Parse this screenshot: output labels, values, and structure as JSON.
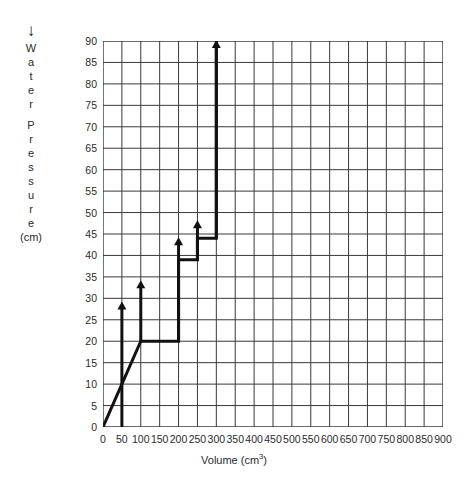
{
  "chart_data": {
    "type": "line",
    "title": "",
    "xlabel": "Volume (cm3)",
    "xlabel_base": "Volume (cm",
    "xlabel_sup": "3",
    "xlabel_tail": ")",
    "ylabel": "Water Pressure (cm)",
    "ylabel_letters": [
      "W",
      "a",
      "t",
      "e",
      "r",
      "",
      "P",
      "r",
      "e",
      "s",
      "s",
      "u",
      "r",
      "e"
    ],
    "ylabel_unit": "(cm)",
    "ylabel_arrow": "↓",
    "xlim": [
      0,
      900
    ],
    "ylim": [
      0,
      90
    ],
    "xtick_step": 50,
    "ytick_step": 5,
    "xticks": [
      0,
      50,
      100,
      150,
      200,
      250,
      300,
      350,
      400,
      450,
      500,
      550,
      600,
      650,
      700,
      750,
      800,
      850,
      900
    ],
    "yticks": [
      0,
      5,
      10,
      15,
      20,
      25,
      30,
      35,
      40,
      45,
      50,
      55,
      60,
      65,
      70,
      75,
      80,
      85,
      90
    ],
    "grid": true,
    "legend": "none",
    "line_color": "#111111",
    "grid_color": "#3a3a3a",
    "series": [
      {
        "name": "pressure-volume-staircase",
        "points": [
          {
            "x": 0,
            "y": 0
          },
          {
            "x": 100,
            "y": 20
          },
          {
            "x": 200,
            "y": 20
          },
          {
            "x": 200,
            "y": 39
          },
          {
            "x": 250,
            "y": 39
          },
          {
            "x": 250,
            "y": 44
          },
          {
            "x": 300,
            "y": 44
          },
          {
            "x": 300,
            "y": 90
          }
        ]
      }
    ],
    "arrows": [
      {
        "name": "arrow-at-50",
        "x": 50,
        "y_from": 0,
        "y_to": 29
      },
      {
        "name": "arrow-at-100",
        "x": 100,
        "y_from": 20,
        "y_to": 34
      },
      {
        "name": "arrow-at-200",
        "x": 200,
        "y_from": 20,
        "y_to": 44
      },
      {
        "name": "arrow-at-250",
        "x": 250,
        "y_from": 39,
        "y_to": 48
      },
      {
        "name": "arrow-at-300",
        "x": 300,
        "y_from": 44,
        "y_to": 90
      }
    ]
  }
}
